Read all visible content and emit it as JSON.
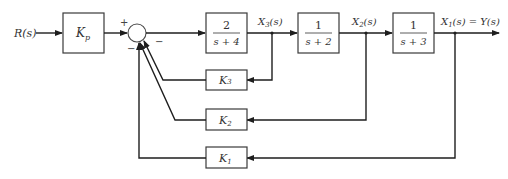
{
  "diagram": {
    "type": "block-diagram",
    "input": {
      "label": "R(s)"
    },
    "blocks": {
      "kp": {
        "label_main": "K",
        "label_sub": "p"
      },
      "g3": {
        "numerator": "2",
        "denominator": "s + 4"
      },
      "g2": {
        "numerator": "1",
        "denominator": "s + 2"
      },
      "g1": {
        "numerator": "1",
        "denominator": "s + 3"
      },
      "k3": {
        "label_main": "K",
        "label_sub": "3"
      },
      "k2": {
        "label_main": "K",
        "label_sub": "2"
      },
      "k1": {
        "label_main": "K",
        "label_sub": "1"
      }
    },
    "signals": {
      "x3": {
        "main": "X",
        "sub": "3",
        "tail": "(s)"
      },
      "x2": {
        "main": "X",
        "sub": "2",
        "tail": "(s)"
      },
      "x1": {
        "main": "X",
        "sub": "1",
        "tail": "(s) = Y(s)"
      }
    },
    "summing_junction": {
      "signs": {
        "input": "+",
        "k3": "−",
        "k2": "−",
        "k1": "−"
      }
    },
    "colors": {
      "line": "#1e1e1e",
      "block_border": "#3a3a3a",
      "text": "#333333"
    }
  }
}
